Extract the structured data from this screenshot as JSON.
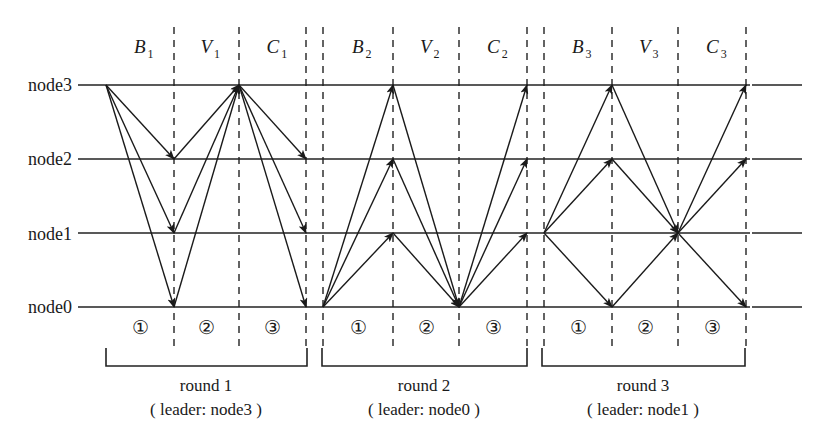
{
  "nodes": [
    {
      "id": "node3",
      "label": "node3"
    },
    {
      "id": "node2",
      "label": "node2"
    },
    {
      "id": "node1",
      "label": "node1"
    },
    {
      "id": "node0",
      "label": "node0"
    }
  ],
  "rounds": [
    {
      "label": "round 1",
      "leader_text": "( leader: node3 )",
      "leader": "node3",
      "phases": [
        {
          "letter": "B",
          "sub": "1"
        },
        {
          "letter": "V",
          "sub": "1"
        },
        {
          "letter": "C",
          "sub": "1"
        }
      ],
      "steps": [
        "①",
        "②",
        "③"
      ],
      "messages": [
        {
          "phase": 0,
          "from": "node3",
          "to": [
            "node2",
            "node1",
            "node0"
          ]
        },
        {
          "phase": 1,
          "from": [
            "node2",
            "node1",
            "node0"
          ],
          "to": "node3"
        },
        {
          "phase": 2,
          "from": "node3",
          "to": [
            "node2",
            "node1",
            "node0"
          ]
        }
      ]
    },
    {
      "label": "round 2",
      "leader_text": "( leader: node0 )",
      "leader": "node0",
      "phases": [
        {
          "letter": "B",
          "sub": "2"
        },
        {
          "letter": "V",
          "sub": "2"
        },
        {
          "letter": "C",
          "sub": "2"
        }
      ],
      "steps": [
        "①",
        "②",
        "③"
      ],
      "messages": [
        {
          "phase": 0,
          "from": "node0",
          "to": [
            "node3",
            "node2",
            "node1"
          ]
        },
        {
          "phase": 1,
          "from": [
            "node3",
            "node2",
            "node1"
          ],
          "to": "node0"
        },
        {
          "phase": 2,
          "from": "node0",
          "to": [
            "node3",
            "node2",
            "node1"
          ]
        }
      ]
    },
    {
      "label": "round 3",
      "leader_text": "( leader: node1 )",
      "leader": "node1",
      "phases": [
        {
          "letter": "B",
          "sub": "3"
        },
        {
          "letter": "V",
          "sub": "3"
        },
        {
          "letter": "C",
          "sub": "3"
        }
      ],
      "steps": [
        "①",
        "②",
        "③"
      ],
      "messages": [
        {
          "phase": 0,
          "from": "node1",
          "to": [
            "node3",
            "node2",
            "node0"
          ]
        },
        {
          "phase": 1,
          "from": [
            "node3",
            "node2",
            "node0"
          ],
          "to": "node1"
        },
        {
          "phase": 2,
          "from": "node1",
          "to": [
            "node3",
            "node2",
            "node0"
          ]
        }
      ]
    }
  ]
}
